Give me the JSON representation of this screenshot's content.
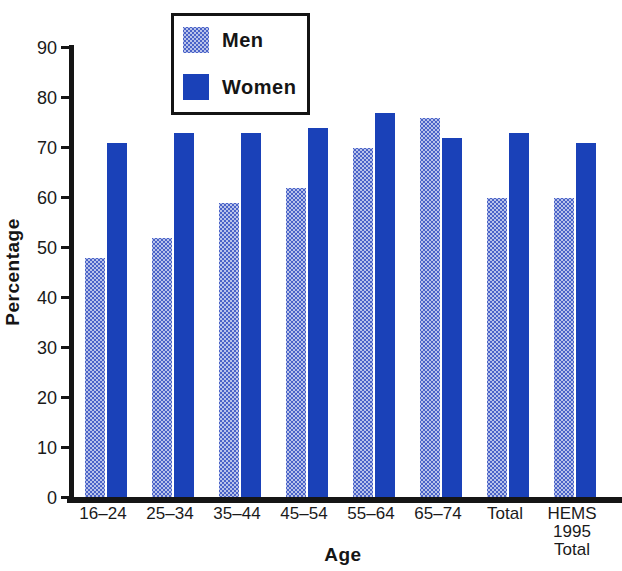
{
  "figure": {
    "background": "#ffffff",
    "text_color": "#151515",
    "axis_color": "#151515"
  },
  "chart_data": {
    "type": "bar",
    "title": "",
    "xlabel": "Age",
    "ylabel": "Percentage",
    "ylim": [
      0,
      90
    ],
    "yticks": [
      0,
      10,
      20,
      30,
      40,
      50,
      60,
      70,
      80,
      90
    ],
    "grid": false,
    "categories": [
      "16–24",
      "25–34",
      "35–44",
      "45–54",
      "55–64",
      "65–74",
      "Total",
      "HEMS\n1995\nTotal"
    ],
    "series": [
      {
        "name": "Men",
        "pattern": "halftone-dots",
        "base_color": "#b9c3ea",
        "dot_color": "#4a63c8",
        "average_color": "#8e9edd",
        "values": [
          48,
          52,
          59,
          62,
          70,
          76,
          60,
          60
        ]
      },
      {
        "name": "Women",
        "pattern": "solid",
        "color": "#1a41b8",
        "values": [
          71,
          73,
          73,
          74,
          77,
          72,
          73,
          71
        ]
      }
    ],
    "legend": {
      "position": "top-left-inside",
      "border_color": "#141414",
      "entries": [
        "Men",
        "Women"
      ]
    }
  }
}
